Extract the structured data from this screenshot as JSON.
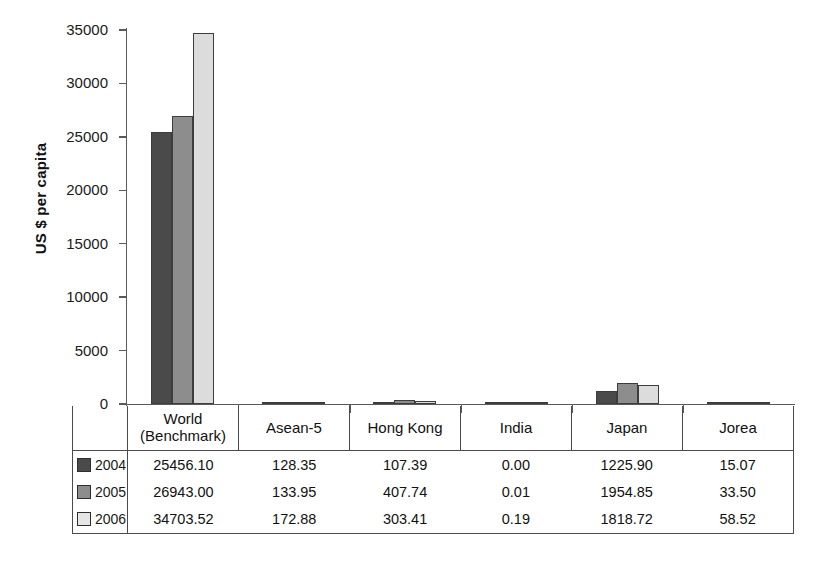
{
  "chart_data": {
    "type": "bar",
    "title": "",
    "xlabel": "",
    "ylabel": "US $ per capita",
    "ylim": [
      0,
      35000
    ],
    "yticks": [
      "0",
      "5000",
      "10000",
      "15000",
      "20000",
      "25000",
      "30000",
      "35000"
    ],
    "grid": false,
    "legend_position": "table-left-column",
    "categories": [
      "World\n(Benchmark)",
      "Asean-5",
      "Hong Kong",
      "India",
      "Japan",
      "Jorea"
    ],
    "category_lines": [
      [
        "World",
        "(Benchmark)"
      ],
      [
        "Asean-5"
      ],
      [
        "Hong Kong"
      ],
      [
        "India"
      ],
      [
        "Japan"
      ],
      [
        "Jorea"
      ]
    ],
    "series": [
      {
        "name": "2004",
        "color": "#4a4a4a",
        "values": [
          25456.1,
          128.35,
          107.39,
          0.0,
          1225.9,
          15.07
        ],
        "labels": [
          "25456.10",
          "128.35",
          "107.39",
          "0.00",
          "1225.90",
          "15.07"
        ]
      },
      {
        "name": "2005",
        "color": "#8d8d8d",
        "values": [
          26943.0,
          133.95,
          407.74,
          0.01,
          1954.85,
          33.5
        ],
        "labels": [
          "26943.00",
          "133.95",
          "407.74",
          "0.01",
          "1954.85",
          "33.50"
        ]
      },
      {
        "name": "2006",
        "color": "#dcdcdc",
        "values": [
          34703.52,
          172.88,
          303.41,
          0.19,
          1818.72,
          58.52
        ],
        "labels": [
          "34703.52",
          "172.88",
          "303.41",
          "0.19",
          "1818.72",
          "58.52"
        ]
      }
    ]
  }
}
